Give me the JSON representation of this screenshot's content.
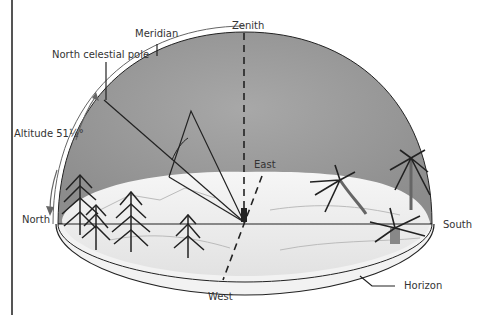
{
  "diagram": {
    "labels": {
      "zenith": "Zenith",
      "meridian": "Meridian",
      "north_celestial_pole": "North celestial pole",
      "altitude": "Altitude 51½°",
      "east": "East",
      "north": "North",
      "south": "South",
      "west": "West",
      "horizon": "Horizon"
    },
    "altitude_degrees": 51.5,
    "colors": {
      "sky": "#9a9a9a",
      "ground": "#eeeeee",
      "line": "#222222",
      "meridian_arc": "#ffffff",
      "border": "#555555"
    }
  }
}
